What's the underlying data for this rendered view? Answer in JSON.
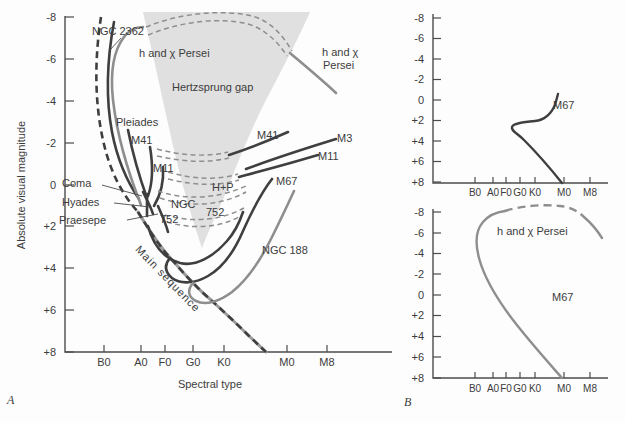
{
  "figure": {
    "background": "#fdfdfd",
    "colors": {
      "dark_curve": "#3f3f3f",
      "gray_curve": "#8e8e8e",
      "main_sequence_gray": "#9b9b9b",
      "gap_fill": "#e0e0e0",
      "axis": "#4c4c4c",
      "text": "#3c3c3c"
    },
    "panel_a": {
      "letter": "A",
      "y_axis_title": "Absolute visual magnitude",
      "x_axis_title": "Spectral type",
      "y_ticks": [
        "-8",
        "-6",
        "-4",
        "-2",
        "0",
        "+2",
        "+4",
        "+6",
        "+8"
      ],
      "x_ticks": [
        "B0",
        "A0",
        "F0",
        "G0",
        "K0",
        "M0",
        "M8"
      ],
      "labels": {
        "ngc2362": "NGC 2362",
        "h_chi_top": "h and χ Persei",
        "gap": "Hertzsprung gap",
        "pleiades": "Pleiades",
        "m41_left": "M41",
        "m11_left": "M11",
        "coma": "Coma",
        "hyades": "Hyades",
        "praesepe": "Praesepe",
        "ngc752_l1": "NGC",
        "ngc752_l2": "752",
        "p752": "752",
        "hp": "H+P",
        "m41_right": "M41",
        "m3": "M3",
        "m11_right": "M11",
        "m67": "M67",
        "h_chi_right_l1": "h and χ",
        "h_chi_right_l2": "Persei",
        "ngc188": "NGC 188",
        "main_sequence": "Main sequence"
      }
    },
    "panel_b": {
      "letter": "B",
      "y_ticks": [
        "-8",
        "-6",
        "-4",
        "-2",
        "0",
        "+2",
        "+4",
        "+6",
        "+8"
      ],
      "x_ticks": [
        "B0",
        "A0",
        "F0",
        "G0",
        "K0",
        "M0",
        "M8"
      ],
      "top": {
        "label": "M67"
      },
      "bottom": {
        "label": "h and χ Persei",
        "label2": "M67"
      }
    }
  },
  "chart_data": [
    {
      "type": "line",
      "title": "Composite H-R diagram of star clusters (panel A)",
      "xlabel": "Spectral type",
      "ylabel": "Absolute visual magnitude",
      "x_categories": [
        "B0",
        "A0",
        "F0",
        "G0",
        "K0",
        "M0",
        "M8"
      ],
      "ylim": [
        8,
        -8
      ],
      "y_axis_inverted": true,
      "shaded_region": "Hertzsprung gap",
      "series": [
        {
          "name": "Main sequence",
          "style": "gray solid with dark dashes",
          "points": [
            [
              "O9",
              -8
            ],
            [
              "B1",
              -5
            ],
            [
              "B5",
              -2
            ],
            [
              "A0",
              1.3
            ],
            [
              "F0",
              3.2
            ],
            [
              "G0",
              4.6
            ],
            [
              "K0",
              6.1
            ],
            [
              "K8",
              8
            ]
          ]
        },
        {
          "name": "NGC 2362",
          "style": "dark solid",
          "points": [
            [
              "B0",
              -7.8
            ],
            [
              "B0",
              -2.5
            ],
            [
              "A0",
              0.7
            ]
          ]
        },
        {
          "name": "h and χ Persei",
          "style": "gray solid, dashed across Hertzsprung gap",
          "points": [
            [
              "A0",
              1
            ],
            [
              "B0",
              -4
            ],
            [
              "B2",
              -7.3
            ],
            [
              "G8",
              -8.3
            ],
            [
              "M0",
              -6.4
            ],
            [
              "M2",
              -4.2
            ]
          ]
        },
        {
          "name": "Pleiades",
          "style": "dark solid",
          "points": [
            [
              "B6",
              -2.6
            ],
            [
              "B9",
              -0.6
            ],
            [
              "A2",
              0.7
            ]
          ]
        },
        {
          "name": "M41",
          "style": "dark solid, dashed across gap",
          "points": [
            [
              "B9",
              -1.8
            ],
            [
              "A1",
              0.6
            ],
            [
              "K0",
              -1.4
            ],
            [
              "M0",
              -2.5
            ]
          ]
        },
        {
          "name": "M11",
          "style": "dark solid, dashed across gap",
          "points": [
            [
              "A2",
              -0.8
            ],
            [
              "A4",
              1
            ],
            [
              "K4",
              -0.4
            ],
            [
              "M6",
              -1.4
            ]
          ]
        },
        {
          "name": "M3",
          "style": "dark solid",
          "points": [
            [
              "K6",
              -0.8
            ],
            [
              "M6",
              -2.2
            ]
          ]
        },
        {
          "name": "Coma",
          "style": "dark solid",
          "points": [
            [
              "A3",
              0.4
            ],
            [
              "F0",
              1.5
            ]
          ]
        },
        {
          "name": "Hyades",
          "style": "dark solid",
          "points": [
            [
              "A2",
              0.5
            ],
            [
              "F2",
              1.6
            ]
          ]
        },
        {
          "name": "Praesepe",
          "style": "dark solid",
          "points": [
            [
              "A5",
              1
            ],
            [
              "F4",
              2.4
            ]
          ]
        },
        {
          "name": "H+P",
          "style": "thin dashed pair",
          "points": [
            [
              "F0",
              0.3
            ],
            [
              "G5",
              1.1
            ],
            [
              "K3",
              0
            ]
          ]
        },
        {
          "name": "NGC 752",
          "style": "dark solid with dashed branch",
          "points": [
            [
              "A5",
              2
            ],
            [
              "F6",
              3.8
            ],
            [
              "K0",
              2.7
            ],
            [
              "K3",
              1.3
            ]
          ]
        },
        {
          "name": "M67",
          "style": "dark solid",
          "points": [
            [
              "F2",
              3.5
            ],
            [
              "F3",
              4.5
            ],
            [
              "G5",
              4.4
            ],
            [
              "K4",
              2.2
            ],
            [
              "K8",
              -0.3
            ]
          ]
        },
        {
          "name": "NGC 188",
          "style": "gray solid",
          "points": [
            [
              "F8",
              4.7
            ],
            [
              "G3",
              5.6
            ],
            [
              "K2",
              3.4
            ],
            [
              "K8",
              1
            ],
            [
              "M0",
              0.3
            ]
          ]
        }
      ]
    },
    {
      "type": "line",
      "title": "M67 (panel B, top)",
      "x_categories": [
        "B0",
        "A0",
        "F0",
        "G0",
        "K0",
        "M0",
        "M8"
      ],
      "ylim": [
        8,
        -8
      ],
      "y_axis_inverted": true,
      "series": [
        {
          "name": "M67",
          "style": "dark solid",
          "points": [
            [
              "M0",
              8
            ],
            [
              "G0",
              3.9
            ],
            [
              "F9",
              2.6
            ],
            [
              "K0",
              2.1
            ],
            [
              "K7",
              0.5
            ],
            [
              "K8",
              -0.6
            ]
          ]
        }
      ]
    },
    {
      "type": "line",
      "title": "h and χ Persei (panel B, bottom)",
      "x_categories": [
        "B0",
        "A0",
        "F0",
        "G0",
        "K0",
        "M0",
        "M8"
      ],
      "ylim": [
        8,
        -8
      ],
      "y_axis_inverted": true,
      "annotations": [
        "M67"
      ],
      "series": [
        {
          "name": "h and χ Persei",
          "style": "gray solid, dashed at top",
          "points": [
            [
              "M0",
              7.8
            ],
            [
              "G0",
              2.4
            ],
            [
              "B1",
              -3.5
            ],
            [
              "B3",
              -6.9
            ],
            [
              "F0",
              -7.9
            ],
            [
              "M7",
              -7.4
            ],
            [
              "M8",
              -5.4
            ]
          ]
        }
      ]
    }
  ]
}
